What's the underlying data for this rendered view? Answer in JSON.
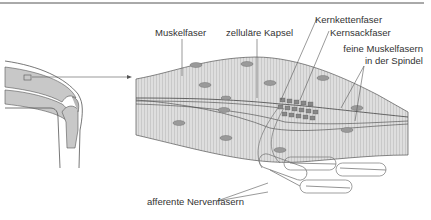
{
  "diagram": {
    "labels": {
      "muscle_fiber": "Muskelfaser",
      "capsule": "zelluläre Kapsel",
      "nuclear_chain": "Kernkettenfaser",
      "nuclear_bag": "Kernsackfaser",
      "fine_fibers_line1": "feine Muskelfasern",
      "fine_fibers_line2": "in der Spindel",
      "afferent": "afferente Nervenfasern"
    },
    "colors": {
      "muscle_fill": "#d8d8d8",
      "nucleus_fill": "#9a9a9a",
      "line": "#555555",
      "bone_fill": "#c8c8c8"
    }
  }
}
